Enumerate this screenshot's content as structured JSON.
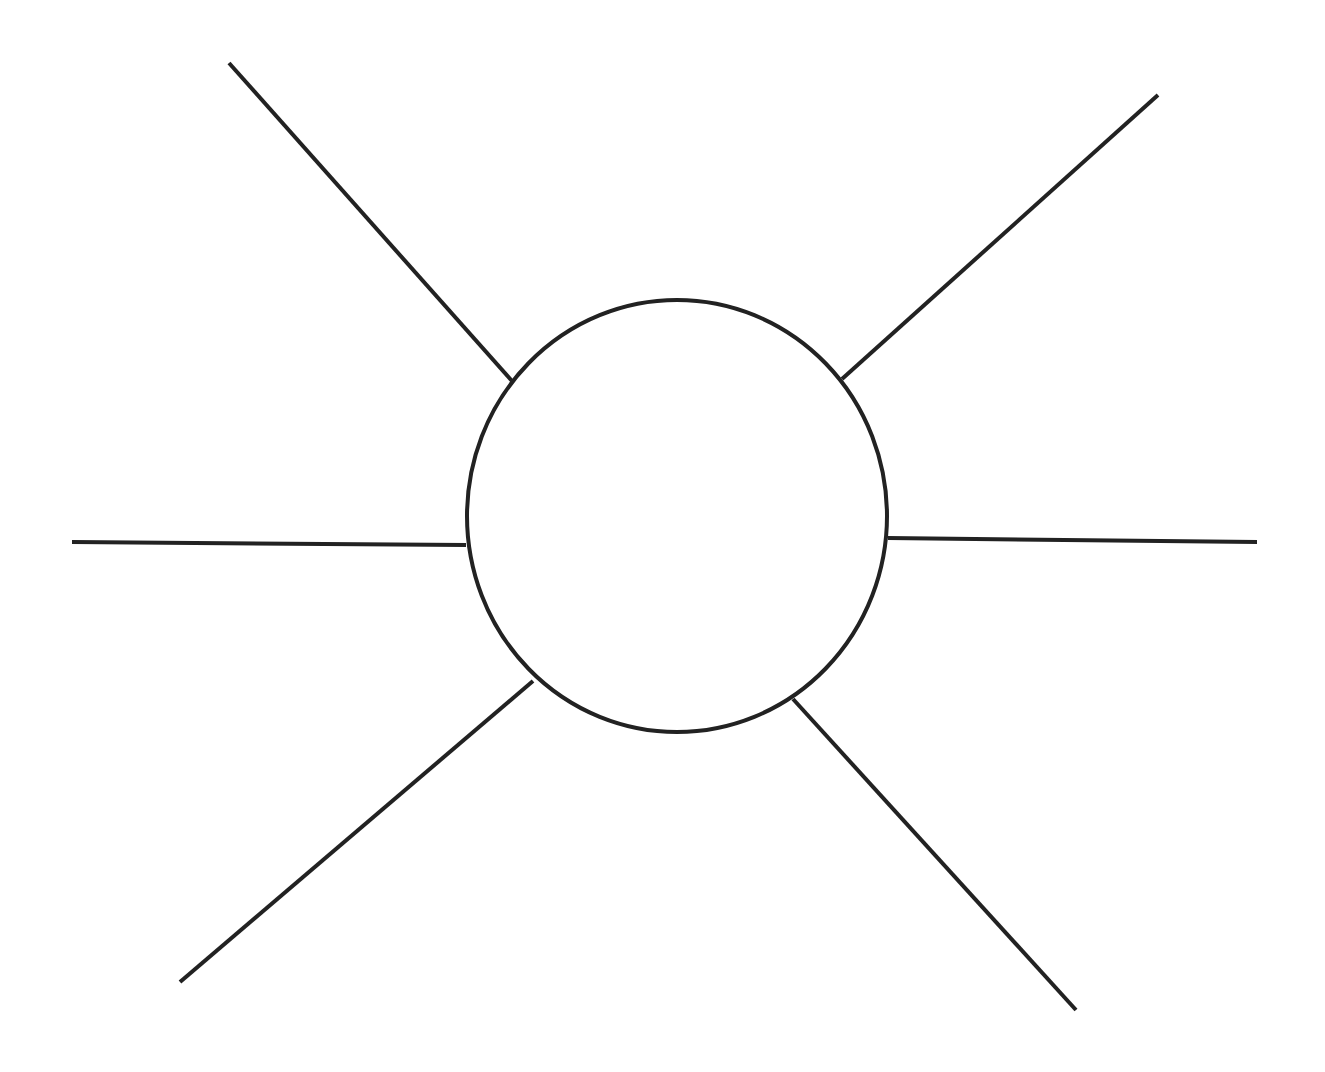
{
  "diagram": {
    "type": "spider-web-organizer",
    "title": "",
    "stroke_color": "#222222",
    "background_color": "#ffffff",
    "stroke_width": 4,
    "hub": {
      "shape": "ellipse",
      "cx": 677,
      "cy": 516,
      "rx": 210,
      "ry": 216,
      "label": ""
    },
    "spokes": [
      {
        "id": "upper-left",
        "x1": 229,
        "y1": 63,
        "x2": 512,
        "y2": 381,
        "label": ""
      },
      {
        "id": "upper-right",
        "x1": 1158,
        "y1": 95,
        "x2": 842,
        "y2": 379,
        "label": ""
      },
      {
        "id": "left",
        "x1": 72,
        "y1": 542,
        "x2": 466,
        "y2": 545,
        "label": ""
      },
      {
        "id": "right",
        "x1": 1257,
        "y1": 542,
        "x2": 888,
        "y2": 538,
        "label": ""
      },
      {
        "id": "lower-left",
        "x1": 180,
        "y1": 982,
        "x2": 533,
        "y2": 681,
        "label": ""
      },
      {
        "id": "lower-right",
        "x1": 1076,
        "y1": 1010,
        "x2": 793,
        "y2": 699,
        "label": ""
      }
    ]
  }
}
